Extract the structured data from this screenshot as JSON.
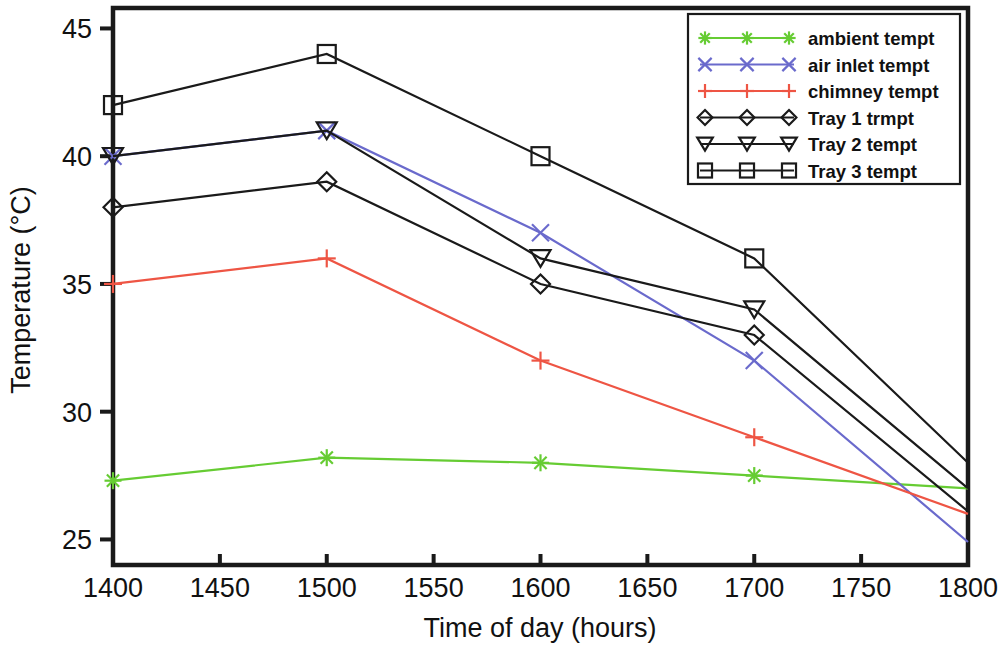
{
  "chart_data": {
    "type": "line",
    "title": "",
    "xlabel": "Time of day (hours)",
    "ylabel": "Temperature (°C)",
    "x": [
      1400,
      1500,
      1600,
      1700,
      1800
    ],
    "xlim": [
      1400,
      1800
    ],
    "ylim": [
      24.0,
      45.8
    ],
    "xticks": [
      1400,
      1450,
      1500,
      1550,
      1600,
      1650,
      1700,
      1750,
      1800
    ],
    "xtick_labels": [
      "1400",
      "1450",
      "1500",
      "1550",
      "1600",
      "1650",
      "1700",
      "1750",
      "1800"
    ],
    "yticks": [
      25,
      30,
      35,
      40,
      45
    ],
    "ytick_labels": [
      "25",
      "30",
      "35",
      "40",
      "45"
    ],
    "grid": false,
    "legend_position": "top-right",
    "series": [
      {
        "name": "ambient tempt",
        "color": "#66cc33",
        "marker": "asterisk",
        "values": [
          27.3,
          28.2,
          28.0,
          27.5,
          27.0
        ]
      },
      {
        "name": "air inlet tempt",
        "color": "#6a6acc",
        "marker": "cross-x",
        "values": [
          40.0,
          41.0,
          37.0,
          32.0,
          24.9
        ]
      },
      {
        "name": "chimney tempt",
        "color": "#ee5544",
        "marker": "plus",
        "values": [
          35.0,
          36.0,
          32.0,
          29.0,
          26.0
        ]
      },
      {
        "name": "Tray 1 trmpt",
        "color": "#1a1a1a",
        "marker": "diamond",
        "values": [
          38.0,
          39.0,
          35.0,
          33.0,
          26.1
        ]
      },
      {
        "name": "Tray 2 tempt",
        "color": "#1a1a1a",
        "marker": "triangle-down",
        "values": [
          40.0,
          41.0,
          36.0,
          34.0,
          27.0
        ]
      },
      {
        "name": "Tray 3 tempt",
        "color": "#1a1a1a",
        "marker": "square",
        "values": [
          42.0,
          44.0,
          40.0,
          36.0,
          28.0
        ]
      }
    ]
  },
  "legend": {
    "entries": [
      "ambient tempt",
      "air inlet tempt",
      "chimney tempt",
      "Tray 1 trmpt",
      "Tray 2 tempt",
      "Tray 3 tempt"
    ]
  }
}
